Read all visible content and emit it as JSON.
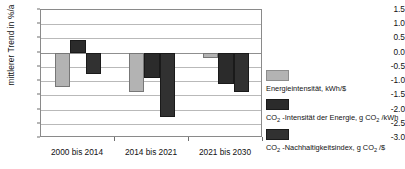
{
  "chart_data": {
    "type": "bar",
    "title": "",
    "xlabel": "",
    "ylabel": "mittlerer Trend in %/a",
    "ylim": [
      -3.0,
      1.5
    ],
    "ystep": 0.5,
    "grid": true,
    "legend_position": "right",
    "categories": [
      "2000 bis 2014",
      "2014 bis 2021",
      "2021 bis 2030"
    ],
    "yticks": [
      "1.5",
      "1.0",
      "0.5",
      "0.0",
      "-0.5",
      "-1.0",
      "-1.5",
      "-2.0",
      "-2.5",
      "-3.0"
    ],
    "ytick_values": [
      1.5,
      1.0,
      0.5,
      0.0,
      -0.5,
      -1.0,
      -1.5,
      -2.0,
      -2.5,
      -3.0
    ],
    "series": [
      {
        "name": "Energieintensität, kWh/$",
        "color": "#b3b3b3",
        "values": [
          -1.2,
          -1.4,
          -0.2
        ]
      },
      {
        "name": "CO2 -Intensität der Energie, g CO2 /kWh",
        "color": "#2b2b2b",
        "values": [
          0.45,
          -0.9,
          -1.1
        ]
      },
      {
        "name": "CO2 -Nachhaltigkeitsindex, g CO2 /$",
        "color": "#313131",
        "values": [
          -0.75,
          -2.25,
          -1.4
        ]
      }
    ]
  },
  "legend": {
    "items": [
      {
        "swatch_color": "#b3b3b3",
        "prefix": "Energieintensität, kWh/$",
        "sub1": "",
        "mid": "",
        "sub2": "",
        "suffix": ""
      },
      {
        "swatch_color": "#2b2b2b",
        "prefix": "CO",
        "sub1": "2",
        "mid": " -Intensität der Energie, g CO",
        "sub2": "2",
        "suffix": " /kWh"
      },
      {
        "swatch_color": "#313131",
        "prefix": "CO",
        "sub1": "2",
        "mid": " -Nachhaltigkeitsindex, g CO",
        "sub2": "2",
        "suffix": " /$"
      }
    ]
  },
  "axis": {
    "y_title": "mittlerer Trend in %/a"
  }
}
